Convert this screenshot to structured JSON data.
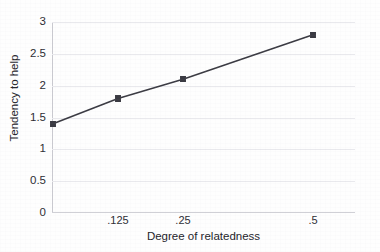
{
  "chart_data": {
    "type": "line",
    "title": "",
    "xlabel": "Degree of relatedness",
    "ylabel": "Tendency to help",
    "categories": [
      "",
      ".125",
      ".25",
      ".5"
    ],
    "x_tick_labels": [
      ".125",
      ".25",
      ".5"
    ],
    "values": [
      1.4,
      1.8,
      2.1,
      2.8
    ],
    "series": [
      {
        "name": "Tendency to help",
        "values": [
          1.4,
          1.8,
          2.1,
          2.8
        ]
      }
    ],
    "points": [
      {
        "x_label": "",
        "x_px": 53,
        "y": 1.4
      },
      {
        "x_label": ".125",
        "x_px": 118,
        "y": 1.8
      },
      {
        "x_label": ".25",
        "x_px": 183,
        "y": 2.1
      },
      {
        "x_label": ".5",
        "x_px": 313,
        "y": 2.8
      }
    ],
    "ylim": [
      0,
      3
    ],
    "y_tick_labels": [
      "0",
      "0.5",
      "1",
      "1.5",
      "2",
      "2.5",
      "3"
    ],
    "y_tick_values": [
      0,
      0.5,
      1,
      1.5,
      2,
      2.5,
      3
    ],
    "grid": "horizontal",
    "legend": "none",
    "marker": "square",
    "colors": {
      "line": "#3a3a42",
      "marker": "#3a3a42",
      "gridline": "#e9e9ed",
      "axis": "#c9c9cf",
      "text": "#23232a",
      "background": "#fefefe"
    }
  }
}
